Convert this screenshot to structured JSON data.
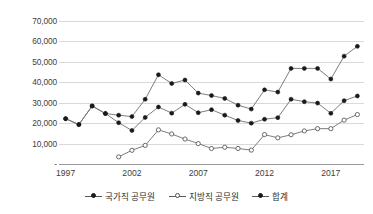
{
  "chart_data": {
    "type": "line",
    "title": "",
    "xlabel": "",
    "ylabel": "",
    "x": [
      1997,
      1998,
      1999,
      2000,
      2001,
      2002,
      2003,
      2004,
      2005,
      2006,
      2007,
      2008,
      2009,
      2010,
      2011,
      2012,
      2013,
      2014,
      2015,
      2016,
      2017,
      2018,
      2019
    ],
    "xlim": [
      1996.5,
      2019.5
    ],
    "ylim": [
      0,
      70000
    ],
    "ytick_labels": [
      "-",
      "10,000",
      "20,000",
      "30,000",
      "40,000",
      "50,000",
      "60,000",
      "70,000"
    ],
    "ytick_values": [
      0,
      10000,
      20000,
      30000,
      40000,
      50000,
      60000,
      70000
    ],
    "xtick_labels": [
      "1997",
      "2002",
      "2007",
      "2012",
      "2017"
    ],
    "xtick_values": [
      1997,
      2002,
      2007,
      2012,
      2017
    ],
    "grid": true,
    "legend_position": "bottom",
    "series": [
      {
        "name": "국가직 공무원",
        "marker": "filled-circle",
        "color": "#1a1a1a",
        "x": [
          1997,
          1998,
          1999,
          2000,
          2001,
          2002,
          2003,
          2004,
          2005,
          2006,
          2007,
          2008,
          2009,
          2010,
          2011,
          2012,
          2013,
          2014,
          2015,
          2016,
          2017,
          2018,
          2019
        ],
        "values": [
          22200,
          19300,
          28400,
          24700,
          20200,
          16400,
          22800,
          27900,
          24900,
          29200,
          25100,
          26600,
          23900,
          21300,
          20000,
          21900,
          22700,
          31700,
          30500,
          29800,
          24800,
          31000,
          33300
        ]
      },
      {
        "name": "지방직 공무원",
        "marker": "hollow-circle",
        "color": "#4d4d4d",
        "x": [
          2001,
          2002,
          2003,
          2004,
          2005,
          2006,
          2007,
          2008,
          2009,
          2010,
          2011,
          2012,
          2013,
          2014,
          2015,
          2016,
          2017,
          2018,
          2019
        ],
        "values": [
          3500,
          6700,
          9100,
          16700,
          14700,
          12200,
          10000,
          7600,
          8200,
          7600,
          6800,
          14400,
          12800,
          14300,
          16200,
          17300,
          17300,
          21500,
          24200
        ]
      },
      {
        "name": "합계",
        "marker": "filled-circle",
        "color": "#1a1a1a",
        "x": [
          1997,
          1998,
          1999,
          2000,
          2001,
          2002,
          2003,
          2004,
          2005,
          2006,
          2007,
          2008,
          2009,
          2010,
          2011,
          2012,
          2013,
          2014,
          2015,
          2016,
          2017,
          2018,
          2019
        ],
        "values": [
          22200,
          19300,
          28400,
          24700,
          23900,
          23200,
          31700,
          43700,
          39400,
          41100,
          34700,
          33500,
          32100,
          28800,
          26900,
          36300,
          35200,
          46800,
          46800,
          46800,
          41600,
          52800,
          57600
        ]
      }
    ]
  },
  "legend": {
    "items": [
      {
        "label": "국가직 공무원",
        "marker": "filled-circle"
      },
      {
        "label": "지방직 공무원",
        "marker": "hollow-circle"
      },
      {
        "label": "합계",
        "marker": "filled-circle"
      }
    ]
  }
}
